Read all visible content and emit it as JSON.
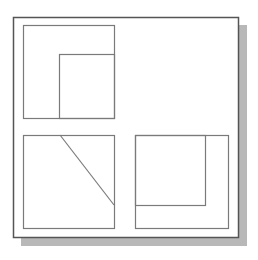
{
  "canvas": {
    "width": 258,
    "height": 260,
    "background": "#ffffff"
  },
  "colors": {
    "frame_stroke": "#555555",
    "box_stroke": "#7a7a7a",
    "shadow": "#b8b8b8"
  },
  "frame": {
    "x": 13,
    "y": 17,
    "width": 225,
    "height": 220
  },
  "shadow": {
    "offset_x": 8,
    "offset_y": 8
  },
  "panels": [
    {
      "name": "top-left",
      "box": {
        "x": 23,
        "y": 25,
        "width": 91,
        "height": 93
      },
      "inner": {
        "x": 59,
        "y": 54,
        "width": 55,
        "height": 64
      }
    },
    {
      "name": "bottom-left",
      "box": {
        "x": 23,
        "y": 135,
        "width": 91,
        "height": 93
      },
      "diagonal": {
        "x1": 60,
        "y1": 135,
        "x2": 114,
        "y2": 205
      }
    },
    {
      "name": "bottom-right",
      "box": {
        "x": 135,
        "y": 135,
        "width": 93,
        "height": 93
      },
      "inner": {
        "x": 135,
        "y": 135,
        "width": 70,
        "height": 70
      }
    }
  ]
}
